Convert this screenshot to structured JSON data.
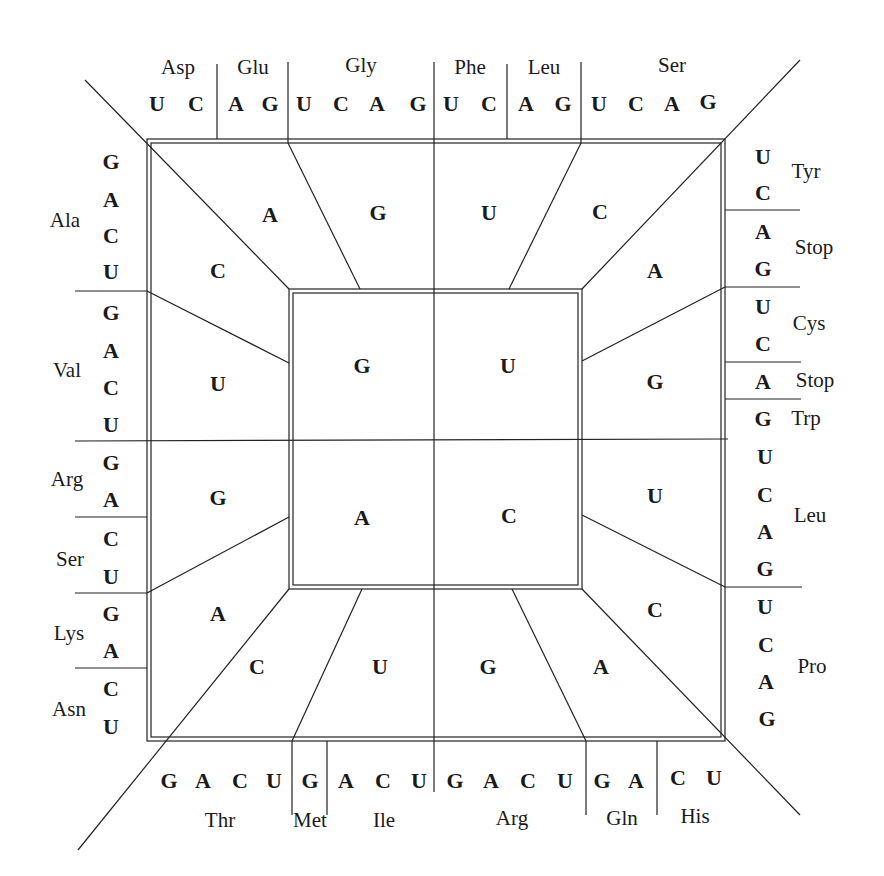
{
  "inner_ring": {
    "first_bases": [
      {
        "id": "tl",
        "base": "G"
      },
      {
        "id": "tr",
        "base": "U"
      },
      {
        "id": "bl",
        "base": "A"
      },
      {
        "id": "br",
        "base": "C"
      }
    ]
  },
  "middle_ring": {
    "second_bases": [
      {
        "id": "top1",
        "base": "A"
      },
      {
        "id": "top2",
        "base": "G"
      },
      {
        "id": "top3",
        "base": "U"
      },
      {
        "id": "top4",
        "base": "C"
      },
      {
        "id": "right1",
        "base": "A"
      },
      {
        "id": "right2",
        "base": "G"
      },
      {
        "id": "right3",
        "base": "U"
      },
      {
        "id": "right4",
        "base": "C"
      },
      {
        "id": "bottom1",
        "base": "C"
      },
      {
        "id": "bottom2",
        "base": "U"
      },
      {
        "id": "bottom3",
        "base": "G"
      },
      {
        "id": "bottom4",
        "base": "A"
      },
      {
        "id": "left1",
        "base": "C"
      },
      {
        "id": "left2",
        "base": "U"
      },
      {
        "id": "left3",
        "base": "G"
      },
      {
        "id": "left4",
        "base": "A"
      }
    ]
  },
  "outer_ring": {
    "top": {
      "bases": [
        "U",
        "C",
        "A",
        "G",
        "U",
        "C",
        "A",
        "G",
        "U",
        "C",
        "A",
        "G",
        "U",
        "C",
        "A",
        "G"
      ],
      "amino_acids": [
        "Asp",
        "Glu",
        "Gly",
        "Phe",
        "Leu",
        "Ser"
      ]
    },
    "right": {
      "bases": [
        "U",
        "C",
        "A",
        "G",
        "U",
        "C",
        "A",
        "G",
        "U",
        "C",
        "A",
        "G",
        "U",
        "C",
        "A",
        "G"
      ],
      "amino_acids": [
        "Tyr",
        "Stop",
        "Cys",
        "Stop",
        "Trp",
        "Leu",
        "Pro"
      ]
    },
    "bottom": {
      "bases": [
        "G",
        "A",
        "C",
        "U",
        "G",
        "A",
        "C",
        "U",
        "G",
        "A",
        "C",
        "U",
        "G",
        "A",
        "C",
        "U"
      ],
      "amino_acids": [
        "Thr",
        "Met",
        "Ile",
        "Arg",
        "Gln",
        "His"
      ]
    },
    "left": {
      "bases": [
        "G",
        "A",
        "C",
        "U",
        "G",
        "A",
        "C",
        "U",
        "G",
        "A",
        "C",
        "U",
        "G",
        "A",
        "C",
        "U"
      ],
      "amino_acids": [
        "Ala",
        "Val",
        "Arg",
        "Ser",
        "Lys",
        "Asn"
      ]
    }
  }
}
